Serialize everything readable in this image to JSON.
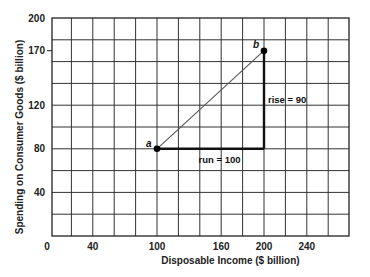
{
  "chart_data": {
    "type": "line",
    "title": "",
    "xlabel": "Disposable Income ($ billion)",
    "ylabel": "Spending on Consumer Goods ($ billion)",
    "xlim": [
      0,
      280
    ],
    "ylim": [
      0,
      200
    ],
    "grid": true,
    "grid_step_x": 20,
    "grid_step_y": 20,
    "x_ticks": [
      0,
      40,
      100,
      160,
      200,
      240
    ],
    "y_ticks": [
      40,
      80,
      120,
      170,
      200
    ],
    "series": [
      {
        "name": "a to b",
        "points": [
          {
            "label": "a",
            "x": 100,
            "y": 80
          },
          {
            "label": "b",
            "x": 200,
            "y": 170
          }
        ]
      }
    ],
    "annotations": [
      {
        "text": "run = 100",
        "from": [
          100,
          80
        ],
        "to": [
          200,
          80
        ]
      },
      {
        "text": "rise = 90",
        "from": [
          200,
          80
        ],
        "to": [
          200,
          170
        ]
      }
    ],
    "legend": null
  },
  "labels": {
    "xlabel": "Disposable Income ($ billion)",
    "ylabel": "Spending on Consumer Goods ($ billion)",
    "run": "run = 100",
    "rise": "rise = 90",
    "point_a": "a",
    "point_b": "b"
  }
}
